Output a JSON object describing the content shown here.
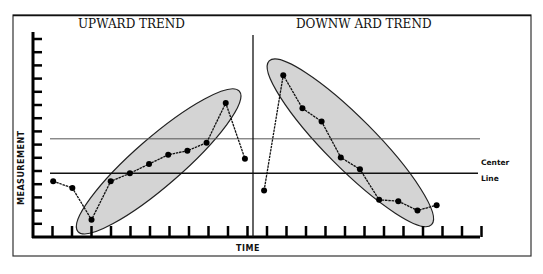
{
  "chart_data": {
    "type": "line",
    "title": "",
    "panels": [
      {
        "title": "UPWARD TREND",
        "x": [
          1,
          2,
          3,
          4,
          5,
          6,
          7,
          8,
          9,
          10,
          11
        ],
        "values": [
          4.2,
          3.7,
          1.3,
          4.2,
          4.8,
          5.5,
          6.2,
          6.5,
          7.1,
          10.1,
          5.9
        ],
        "highlight": "ellipse around points 3-10"
      },
      {
        "title": "DOWNW ARD TREND",
        "x": [
          12,
          13,
          14,
          15,
          16,
          17,
          18,
          19,
          20,
          21
        ],
        "values": [
          3.5,
          12.2,
          9.7,
          8.7,
          6.0,
          5.1,
          2.8,
          2.7,
          2.0,
          2.4
        ],
        "highlight": "ellipse around points 13-20"
      }
    ],
    "xlabel": "TIME",
    "ylabel": "MEASUREMENT",
    "ylim": [
      0,
      15
    ],
    "xlim": [
      0,
      23
    ],
    "center_line": {
      "label_line1": "Center",
      "label_line2": "Line",
      "value": 4.8
    },
    "upper_line": {
      "value": 7.4
    },
    "y_ticks": 15,
    "x_ticks": 23,
    "tick_labels": "none"
  }
}
